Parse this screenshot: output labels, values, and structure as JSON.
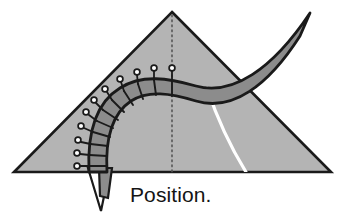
{
  "figure": {
    "caption": "Position.",
    "background_color": "#ffffff",
    "stroke_color": "#1a1a1a",
    "plane": {
      "name": "triangular-plane",
      "fill_color": "#b4b4b4",
      "apex": [
        172,
        12
      ],
      "left_vertex": [
        14,
        172
      ],
      "right_vertex": [
        331,
        172
      ]
    },
    "ribbon": {
      "name": "curved-ribbon",
      "fill_color": "#8c8c8c",
      "tip": [
        310,
        13
      ],
      "marker_count": 10,
      "tick_count": 11
    },
    "flap": {
      "name": "white-flap",
      "fill_color": "#ffffff"
    },
    "center_line": {
      "name": "dotted-center-line",
      "style": "dotted",
      "color": "#555555",
      "from": [
        172,
        14
      ],
      "to": [
        172,
        172
      ]
    },
    "arc": {
      "name": "white-arc",
      "color": "#ffffff"
    }
  }
}
